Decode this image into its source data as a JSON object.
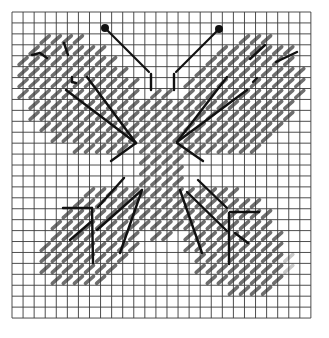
{
  "grid": {
    "x0": 12,
    "y0": 12,
    "cols": 27,
    "rows": 28,
    "cell_w": 11.07,
    "cell_h": 10.93,
    "line_color": "#3a3a3a",
    "line_width": 0.9
  },
  "colors": {
    "stitch": "#6e6e6e",
    "stitch_light": "#c8c8c8",
    "outline": "#111111",
    "background": "#ffffff"
  },
  "wings": [
    {
      "name": "upper-left",
      "cx": 82,
      "cy": 95,
      "rx": 72,
      "ry": 52,
      "angle": 40
    },
    {
      "name": "upper-right",
      "cx": 238,
      "cy": 98,
      "rx": 72,
      "ry": 52,
      "angle": -40
    },
    {
      "name": "lower-left",
      "cx": 95,
      "cy": 235,
      "rx": 62,
      "ry": 42,
      "angle": -45
    },
    {
      "name": "lower-right",
      "cx": 232,
      "cy": 240,
      "rx": 68,
      "ry": 44,
      "angle": 45
    },
    {
      "name": "body",
      "cx": 163,
      "cy": 165,
      "rx": 26,
      "ry": 78,
      "angle": 0
    }
  ],
  "fade_region": {
    "x_min": 288,
    "y_min": 250
  },
  "antennae": [
    {
      "x1": 105,
      "y1": 28,
      "x2": 149,
      "y2": 72,
      "knob_r": 4
    },
    {
      "x1": 219,
      "y1": 29,
      "x2": 176,
      "y2": 72,
      "knob_r": 4
    }
  ],
  "outline_lines": [
    [
      151,
      74,
      151,
      90
    ],
    [
      174,
      74,
      174,
      90
    ],
    [
      32,
      55,
      40,
      53
    ],
    [
      40,
      53,
      47,
      58
    ],
    [
      64,
      43,
      68,
      55
    ],
    [
      72,
      77,
      72,
      82
    ],
    [
      72,
      82,
      76,
      83
    ],
    [
      66,
      90,
      136,
      143
    ],
    [
      87,
      77,
      136,
      143
    ],
    [
      136,
      143,
      111,
      161
    ],
    [
      250,
      59,
      265,
      45
    ],
    [
      276,
      62,
      297,
      52
    ],
    [
      253,
      82,
      257,
      78
    ],
    [
      227,
      77,
      177,
      142
    ],
    [
      247,
      90,
      177,
      142
    ],
    [
      177,
      143,
      203,
      161
    ],
    [
      98,
      207,
      124,
      178
    ],
    [
      63,
      208,
      92,
      208
    ],
    [
      92,
      208,
      93,
      263
    ],
    [
      70,
      240,
      92,
      221
    ],
    [
      97,
      230,
      142,
      190
    ],
    [
      120,
      253,
      142,
      190
    ],
    [
      180,
      190,
      202,
      253
    ],
    [
      187,
      192,
      227,
      231
    ],
    [
      198,
      180,
      227,
      208
    ],
    [
      230,
      212,
      259,
      212
    ],
    [
      229,
      213,
      229,
      264
    ],
    [
      235,
      233,
      248,
      243
    ]
  ]
}
